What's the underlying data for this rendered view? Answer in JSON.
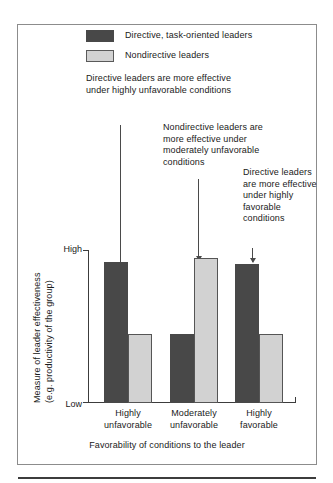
{
  "chart_data": {
    "type": "bar",
    "title": "",
    "categories": [
      "Highly unfavorable",
      "Moderately unfavorable",
      "Highly favorable"
    ],
    "category_lines": [
      [
        "Highly",
        "unfavorable"
      ],
      [
        "Moderately",
        "unfavorable"
      ],
      [
        "Highly",
        "favorable"
      ]
    ],
    "series": [
      {
        "name": "Directive, task-oriented leaders",
        "color": "#484848",
        "values": [
          92,
          45,
          91
        ]
      },
      {
        "name": "Nondirective leaders",
        "color": "#d2d2d2",
        "values": [
          45,
          95,
          45
        ]
      }
    ],
    "xlabel": "Favorability of conditions to the leader",
    "ylabel": "Measure of leader effectiveness (e.g. productivity of the group)",
    "ylabel_lines": [
      "Measure of leader effectiveness",
      "(e.g. productivity of the group)"
    ],
    "ytick_labels": [
      "High",
      "Low"
    ],
    "ylim": [
      0,
      100
    ],
    "grid": false,
    "legend_position": "top"
  },
  "legend": {
    "items": [
      {
        "label": "Directive, task-oriented leaders",
        "swatch": "dark-swatch"
      },
      {
        "label": "Nondirective leaders",
        "swatch": "light-swatch"
      }
    ]
  },
  "annotations": [
    {
      "id": "annotation-highly-unfavorable",
      "text": "Directive leaders are more effective under highly unfavorable conditions",
      "points_to": "Highly unfavorable / Directive"
    },
    {
      "id": "annotation-moderately-unfavorable",
      "text": "Nondirective leaders are more effective under moderately unfavorable conditions",
      "points_to": "Moderately unfavorable / Nondirective"
    },
    {
      "id": "annotation-highly-favorable",
      "text": "Directive leaders are more effective under highly favorable conditions",
      "points_to": "Highly favorable / Directive"
    }
  ],
  "axis": {
    "y_high": "High",
    "y_low": "Low",
    "x_title": "Favorability of conditions to the leader",
    "y_title_line_1": "Measure of leader effectiveness",
    "y_title_line_2": "(e.g. productivity of the group)"
  }
}
